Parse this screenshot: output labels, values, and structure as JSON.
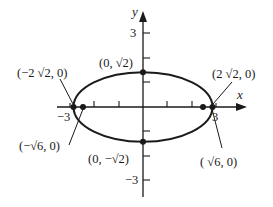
{
  "figure": {
    "type": "ellipse graph",
    "equation_implied": "x^2/8 + y^2/2 = 1",
    "axes": {
      "x_label": "x",
      "y_label": "y",
      "x_ticks": [
        -3,
        -2,
        -1,
        1,
        2,
        3
      ],
      "y_ticks": [
        -3,
        -2,
        -1,
        1,
        2,
        3
      ],
      "x_tick_labels": {
        "neg": "−3",
        "pos": "3"
      },
      "y_tick_labels": {
        "pos": "3",
        "neg": "−3"
      }
    },
    "points": {
      "left_vertex": "(−2 √2, 0)",
      "right_vertex": "(2 √2, 0)",
      "top_covertex": "(0, √2)",
      "bottom_covertex": "(0, −√2)",
      "left_focus": "(−√6, 0)",
      "right_focus": "( √6, 0)"
    },
    "colors": {
      "stroke": "#1a1a1a",
      "background": "#ffffff"
    }
  }
}
